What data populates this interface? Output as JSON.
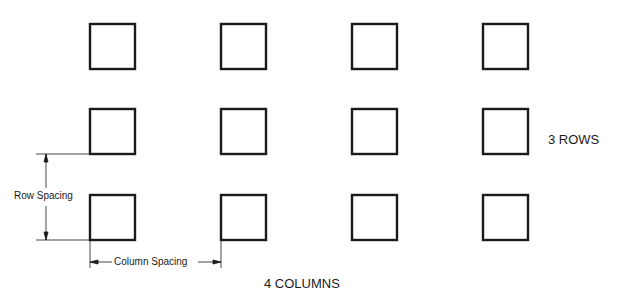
{
  "diagram": {
    "title_rows": "3 ROWS",
    "title_columns": "4 COLUMNS",
    "row_spacing_label": "Row Spacing",
    "column_spacing_label": "Column Spacing",
    "rows": 3,
    "columns": 4,
    "square_size": 45,
    "column_x": [
      90,
      221,
      352,
      483
    ],
    "row_y": [
      24,
      109,
      195
    ],
    "stroke_color": "#1a1a1a"
  }
}
